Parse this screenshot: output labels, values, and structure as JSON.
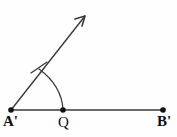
{
  "figure": {
    "background_color": "#fefefe",
    "stroke_color": "#3a3a3a",
    "label_color": "#111111",
    "width": 177,
    "height": 137
  },
  "labels": {
    "vertex_left": "A'",
    "vertex_middle": "Q",
    "vertex_right": "B'"
  },
  "points": {
    "A": {
      "name": "A'",
      "x": 11,
      "y": 110
    },
    "Q": {
      "name": "Q",
      "x": 63,
      "y": 110
    },
    "B": {
      "name": "B'",
      "x": 163,
      "y": 110
    },
    "arrow_tip": {
      "name": "ray-arrow-tip",
      "x": 85,
      "y": 16
    },
    "arc_start": {
      "name": "arc-start-on-ray",
      "x": 39,
      "y": 69
    },
    "tick_mark": {
      "name": "congruence-tick",
      "x": 38,
      "y": 68
    }
  },
  "elements": {
    "base_ray_name": "base-ray-A-to-B",
    "oblique_ray_name": "oblique-ray-with-arrow",
    "arc_name": "angle-arc",
    "tick_name": "congruence-tick-mark"
  },
  "geometry": {
    "base_line_path": "M 11 110 L 163 110",
    "oblique_ray_path": "M 11 110 L 85 16",
    "arrow_head_path": "M 85 16 L 75 19 M 85 16 L 82 26",
    "arc_path": "M 39 69 Q 62 86 63 110",
    "tick_path": "M 31 73 L 47 62"
  }
}
